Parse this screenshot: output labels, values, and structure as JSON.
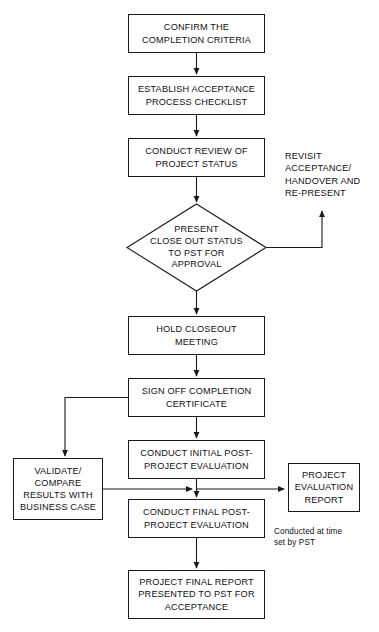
{
  "diagram": {
    "stroke_color": "#1a1a1a",
    "text_color": "#111111",
    "background_color": "#ffffff",
    "nodes": [
      {
        "id": "confirm-criteria",
        "shape": "process",
        "text": "CONFIRM THE\nCOMPLETION CRITERIA",
        "x": 128,
        "y": 14,
        "w": 137,
        "h": 39
      },
      {
        "id": "establish-checklist",
        "shape": "process",
        "text": "ESTABLISH ACCEPTANCE\nPROCESS CHECKLIST",
        "x": 128,
        "y": 76,
        "w": 137,
        "h": 39
      },
      {
        "id": "conduct-review",
        "shape": "process",
        "text": "CONDUCT REVIEW OF\nPROJECT STATUS",
        "x": 128,
        "y": 138,
        "w": 137,
        "h": 39
      },
      {
        "id": "present-close-out",
        "shape": "decision",
        "text": "PRESENT\nCLOSE OUT STATUS\nTO PST FOR\nAPPROVAL",
        "x": 127,
        "y": 204,
        "w": 139,
        "h": 87
      },
      {
        "id": "hold-closeout-meeting",
        "shape": "process",
        "text": "HOLD CLOSEOUT\nMEETING",
        "x": 128,
        "y": 316,
        "w": 137,
        "h": 39
      },
      {
        "id": "sign-off-completion",
        "shape": "process",
        "text": "SIGN OFF COMPLETION\nCERTIFICATE",
        "x": 128,
        "y": 378,
        "w": 137,
        "h": 39
      },
      {
        "id": "conduct-initial-evaluation",
        "shape": "process",
        "text": "CONDUCT INITIAL POST-\nPROJECT EVALUATION",
        "x": 128,
        "y": 440,
        "w": 137,
        "h": 39
      },
      {
        "id": "validate-compare",
        "shape": "process",
        "text": "VALIDATE/\nCOMPARE\nRESULTS WITH\nBUSINESS CASE",
        "x": 13,
        "y": 458,
        "w": 90,
        "h": 62
      },
      {
        "id": "conduct-final-evaluation",
        "shape": "process",
        "text": "CONDUCT FINAL POST-\nPROJECT EVALUATION",
        "x": 128,
        "y": 499,
        "w": 137,
        "h": 39
      },
      {
        "id": "project-evaluation-report",
        "shape": "process",
        "text": "PROJECT\nEVALUATION\nREPORT",
        "x": 288,
        "y": 463,
        "w": 72,
        "h": 49
      },
      {
        "id": "project-final-report",
        "shape": "process",
        "text": "PROJECT FINAL REPORT\nPRESENTED TO PST FOR\nACCEPTANCE",
        "x": 128,
        "y": 570,
        "w": 137,
        "h": 49
      }
    ],
    "labels": [
      {
        "id": "revisit-acceptance",
        "text": "REVISIT\nACCEPTANCE/\nHANDOVER AND\nRE-PRESENT",
        "x": 285,
        "y": 150,
        "style": "plain"
      },
      {
        "id": "conducted-at-time-note",
        "text": "Conducted at time\nset by PST",
        "x": 274,
        "y": 527,
        "style": "note"
      }
    ]
  }
}
